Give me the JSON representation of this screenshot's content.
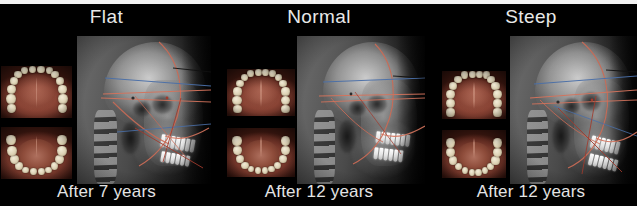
{
  "figure": {
    "kind": "orthodontic-cephalometric-comparison",
    "background_color": "#000000",
    "border_color": "#f2f2f2",
    "title_color": "#e8e8e8",
    "caption_color": "#e4e4e4",
    "trace_colors": {
      "arc": "#c96a55",
      "line_red": "#d4735c",
      "line_blue": "#4a6fa8",
      "line_dark_red": "#a03a2c"
    }
  },
  "panels": [
    {
      "id": "flat",
      "title": "Flat",
      "caption": "After 7 years",
      "intraoral": {
        "upper": "maxillary-occlusal-photo",
        "lower": "mandibular-occlusal-photo"
      },
      "radiograph": "lateral-cephalometric-radiograph"
    },
    {
      "id": "normal",
      "title": "Normal",
      "caption": "After 12 years",
      "intraoral": {
        "upper": "maxillary-occlusal-photo",
        "lower": "mandibular-occlusal-photo"
      },
      "radiograph": "lateral-cephalometric-radiograph"
    },
    {
      "id": "steep",
      "title": "Steep",
      "caption": "After 12 years",
      "intraoral": {
        "upper": "maxillary-occlusal-photo",
        "lower": "mandibular-occlusal-photo"
      },
      "radiograph": "lateral-cephalometric-radiograph"
    }
  ]
}
